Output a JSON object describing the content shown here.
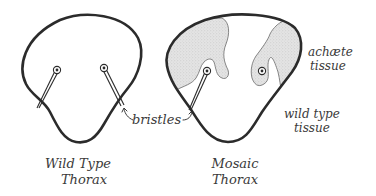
{
  "diagram": {
    "panels": [
      {
        "id": "wild-type",
        "caption_line1": "Wild Type",
        "caption_line2": "Thorax"
      },
      {
        "id": "mosaic",
        "caption_line1": "Mosaic",
        "caption_line2": "Thorax"
      }
    ],
    "labels": {
      "bristles": "bristles",
      "achaete_line1": "achæte",
      "achaete_line2": "tissue",
      "wildtype_line1": "wild type",
      "wildtype_line2": "tissue"
    },
    "colors": {
      "outline": "#2b2b2b",
      "achaete_fill": "#dcdcdc",
      "background": "#ffffff",
      "text": "#3a3a3a"
    }
  }
}
